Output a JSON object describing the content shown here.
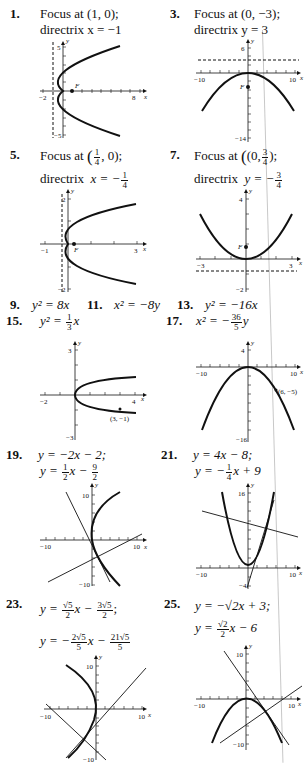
{
  "problems": [
    {
      "number": "1.",
      "lines": [
        "Focus at (1, 0);",
        "directrix x = −1"
      ],
      "graph": {
        "x_ticks": [
          "−2",
          "8"
        ],
        "x_label": "x",
        "y_ticks": [
          "5",
          "−5"
        ],
        "y_label": "y",
        "point_label": "F"
      }
    },
    {
      "number": "3.",
      "lines": [
        "Focus at (0, −3);",
        "directrix y = 3"
      ],
      "graph": {
        "x_ticks": [
          "−10",
          "10"
        ],
        "x_label": "x",
        "y_ticks": [
          "6",
          "−14"
        ],
        "y_label": "y",
        "point_label": "F"
      }
    },
    {
      "number": "5.",
      "line1_prefix": "Focus at",
      "focus_frac": {
        "num": "1",
        "den": "4"
      },
      "focus_suffix": ", 0);",
      "line2_prefix": "directrix",
      "directrix_var": "x = −",
      "directrix_frac": {
        "num": "1",
        "den": "4"
      },
      "graph": {
        "x_ticks": [
          "−1",
          "3"
        ],
        "x_label": "x",
        "y_ticks": [
          "2",
          "−2"
        ],
        "y_label": "y",
        "point_label": "F"
      }
    },
    {
      "number": "7.",
      "line1_prefix": "Focus at",
      "focus_prefix": "(0,",
      "focus_frac": {
        "num": "3",
        "den": "4"
      },
      "focus_suffix": ");",
      "line2_prefix": "directrix",
      "directrix_var": "y = −",
      "directrix_frac": {
        "num": "3",
        "den": "4"
      },
      "graph": {
        "x_ticks": [
          "−3",
          "3"
        ],
        "x_label": "x",
        "y_ticks": [
          "4",
          "−2"
        ],
        "y_label": "y",
        "point_label": "F"
      }
    },
    {
      "number": "9.",
      "equation": "y² = 8x"
    },
    {
      "number": "11.",
      "equation": "x² = −8y"
    },
    {
      "number": "13.",
      "equation": "y² = −16x"
    },
    {
      "number": "15.",
      "equation_prefix": "y² = ",
      "frac": {
        "num": "1",
        "den": "3"
      },
      "equation_suffix": "x",
      "graph": {
        "x_ticks": [
          "−2",
          "4"
        ],
        "x_label": "x",
        "y_ticks": [
          "3",
          "−3"
        ],
        "y_label": "y",
        "point_label": "(3, −1)"
      }
    },
    {
      "number": "17.",
      "equation_prefix": "x² = −",
      "frac": {
        "num": "36",
        "den": "5"
      },
      "equation_suffix": "y",
      "graph": {
        "x_ticks": [
          "−10",
          "10"
        ],
        "x_label": "x",
        "y_ticks": [
          "4",
          "−16"
        ],
        "y_label": "y",
        "point_label": "(6, −5)"
      }
    },
    {
      "number": "19.",
      "line1": "y = −2x − 2;",
      "line2_prefix": "y = ",
      "frac1": {
        "num": "1",
        "den": "2"
      },
      "line2_mid": "x − ",
      "frac2": {
        "num": "9",
        "den": "2"
      },
      "graph": {
        "x_ticks": [
          "−10",
          "10"
        ],
        "x_label": "x",
        "y_ticks": [
          "10",
          "−10"
        ],
        "y_label": "y"
      }
    },
    {
      "number": "21.",
      "line1": "y = 4x − 8;",
      "line2_prefix": "y = −",
      "frac1": {
        "num": "1",
        "den": "4"
      },
      "line2_suffix": "x + 9",
      "graph": {
        "x_ticks": [
          "−10",
          "10"
        ],
        "x_label": "x",
        "y_ticks": [
          "16",
          "−4"
        ],
        "y_label": "y"
      }
    },
    {
      "number": "23.",
      "line1_prefix": "y = ",
      "frac1": {
        "num": "√5",
        "den": "2"
      },
      "line1_mid": "x − ",
      "frac2": {
        "num": "3√5",
        "den": "2"
      },
      "line1_suffix": ";",
      "line2_prefix": "y = −",
      "frac3": {
        "num": "2√5",
        "den": "5"
      },
      "line2_mid": "x − ",
      "frac4": {
        "num": "21√5",
        "den": "5"
      },
      "graph": {
        "x_ticks": [
          "−10",
          "10"
        ],
        "x_label": "x",
        "y_ticks": [
          "10",
          "−10"
        ],
        "y_label": "y"
      }
    },
    {
      "number": "25.",
      "line1": "y = −√2x + 3;",
      "line2_prefix": "y = ",
      "frac1": {
        "num": "√2",
        "den": "2"
      },
      "line2_suffix": "x − 6",
      "graph": {
        "x_ticks": [
          "−10",
          "10"
        ],
        "x_label": "x",
        "y_ticks": [
          "10",
          "−10"
        ],
        "y_label": "y"
      }
    }
  ]
}
